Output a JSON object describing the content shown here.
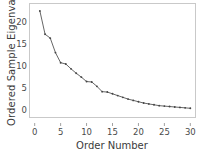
{
  "chart_data": {
    "type": "line",
    "title": "",
    "xlabel": "Order Number",
    "ylabel": "Ordered Sample Eigenvalue",
    "xlim": [
      -1,
      31
    ],
    "ylim": [
      -1.5,
      24.5
    ],
    "xticks": [
      0,
      5,
      10,
      15,
      20,
      25,
      30
    ],
    "yticks": [
      0,
      5,
      10,
      15,
      20
    ],
    "grid": false,
    "legend": null,
    "marker": "dot",
    "line_color": "#555555",
    "marker_color": "#444444",
    "frame_color": "#c9c9c9",
    "x": [
      1,
      2,
      3,
      4,
      5,
      6,
      7,
      8,
      9,
      10,
      11,
      12,
      13,
      14,
      15,
      16,
      17,
      18,
      19,
      20,
      21,
      22,
      23,
      24,
      25,
      26,
      27,
      28,
      29,
      30
    ],
    "values": [
      22.8,
      17.5,
      16.6,
      13.3,
      11.0,
      10.7,
      9.6,
      8.6,
      7.7,
      6.7,
      6.6,
      5.6,
      4.4,
      4.3,
      3.9,
      3.5,
      3.1,
      2.7,
      2.4,
      2.1,
      1.8,
      1.6,
      1.4,
      1.2,
      1.1,
      1.0,
      0.9,
      0.8,
      0.7,
      0.6
    ],
    "series": [
      {
        "name": "Ordered Sample Eigenvalue",
        "values": [
          22.8,
          17.5,
          16.6,
          13.3,
          11.0,
          10.7,
          9.6,
          8.6,
          7.7,
          6.7,
          6.6,
          5.6,
          4.4,
          4.3,
          3.9,
          3.5,
          3.1,
          2.7,
          2.4,
          2.1,
          1.8,
          1.6,
          1.4,
          1.2,
          1.1,
          1.0,
          0.9,
          0.8,
          0.7,
          0.6
        ]
      }
    ]
  }
}
